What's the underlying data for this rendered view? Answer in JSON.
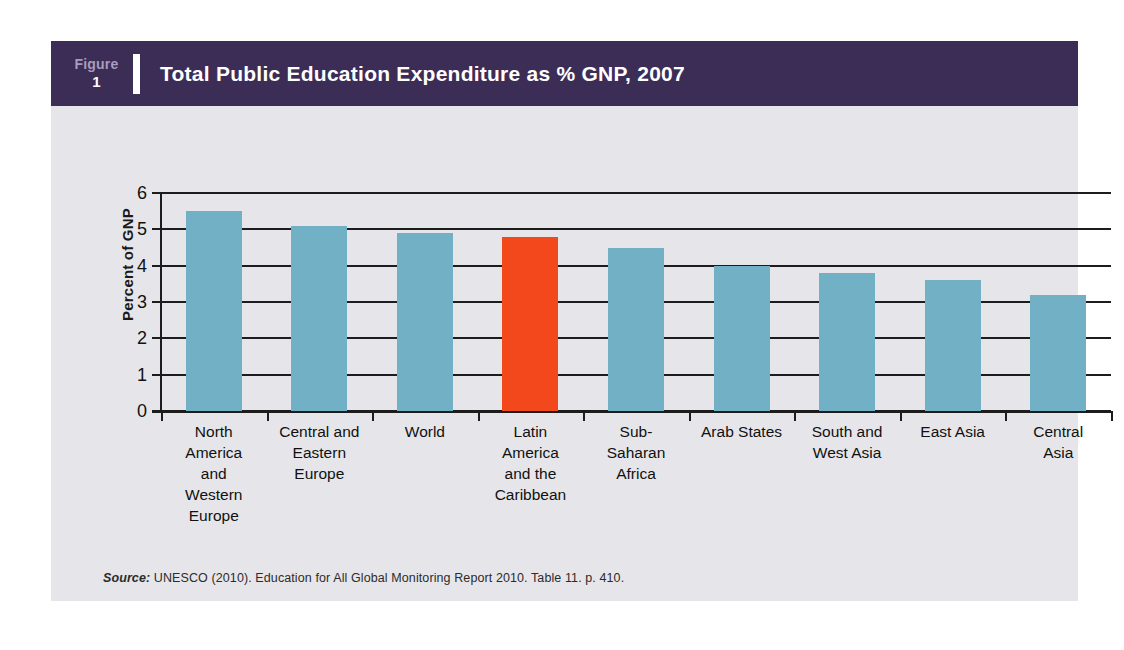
{
  "figure": {
    "tag_word": "Figure",
    "tag_number": "1",
    "title": "Total Public Education Expenditure as % GNP, 2007",
    "source_label": "Source:",
    "source_text": " UNESCO (2010). Education for All Global Monitoring Report 2010.  Table 11. p. 410."
  },
  "colors": {
    "title_bar": "#3c2d57",
    "panel_background": "#e6e6ea",
    "bar_default": "#72b0c5",
    "bar_highlight": "#f2481c",
    "axis": "#1c1c1c"
  },
  "chart_data": {
    "type": "bar",
    "title": "Total Public Education Expenditure as % GNP, 2007",
    "xlabel": "",
    "ylabel": "Percent of GNP",
    "ylim": [
      0,
      6
    ],
    "yticks": [
      0,
      1,
      2,
      3,
      4,
      5,
      6
    ],
    "ytick_labels": [
      "0",
      "1",
      "2",
      "3",
      "4",
      "5",
      "6"
    ],
    "grid": true,
    "legend": false,
    "categories": [
      "North America and Western Europe",
      "Central and Eastern Europe",
      "World",
      "Latin America and the Caribbean",
      "Sub-Saharan Africa",
      "Arab States",
      "South and West Asia",
      "East Asia",
      "Central Asia"
    ],
    "category_lines": [
      [
        "North",
        "America",
        "and",
        "Western",
        "Europe"
      ],
      [
        "Central and",
        "Eastern",
        "Europe"
      ],
      [
        "World"
      ],
      [
        "Latin",
        "America",
        "and the",
        "Caribbean"
      ],
      [
        "Sub-",
        "Saharan",
        "Africa"
      ],
      [
        "Arab States"
      ],
      [
        "South and",
        "West Asia"
      ],
      [
        "East Asia"
      ],
      [
        "Central",
        "Asia"
      ]
    ],
    "values": [
      5.5,
      5.1,
      4.9,
      4.8,
      4.5,
      4.0,
      3.8,
      3.6,
      3.2
    ],
    "highlight_index": 3,
    "bar_colors": [
      "#72b0c5",
      "#72b0c5",
      "#72b0c5",
      "#f2481c",
      "#72b0c5",
      "#72b0c5",
      "#72b0c5",
      "#72b0c5",
      "#72b0c5"
    ]
  }
}
